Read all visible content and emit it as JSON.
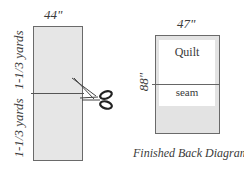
{
  "left_diagram": {
    "width_label": "44\"",
    "upper_length_label": "1-1/3 yards",
    "lower_length_label": "1-1/3 yards",
    "fill_color": "#e6e6e6",
    "icon": "scissors-icon"
  },
  "right_diagram": {
    "width_label": "47\"",
    "height_label": "88\"",
    "quilt_label": "Quilt",
    "seam_label": "seam",
    "fill_color": "#e3e3e3",
    "inner_color": "#ffffff"
  },
  "caption": "Finished Back Diagram"
}
